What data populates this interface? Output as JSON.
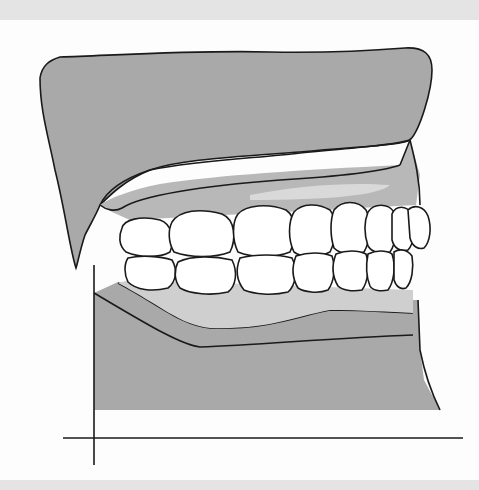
{
  "figure": {
    "colors": {
      "band": "#e4e4e4",
      "background": "#fdfdfd",
      "base_fill": "#a9a9a9",
      "base_edge": "#939393",
      "gum_fill": "#c6c6c6",
      "gum_light": "#d9d9d9",
      "tooth_fill": "#ffffff",
      "outline": "#1a1a1a"
    },
    "parts": [
      "upper-cast-base",
      "upper-gingiva",
      "upper-teeth",
      "lower-teeth",
      "lower-gingiva",
      "lower-cast-base",
      "vertical-reference-line",
      "horizontal-reference-line"
    ]
  }
}
